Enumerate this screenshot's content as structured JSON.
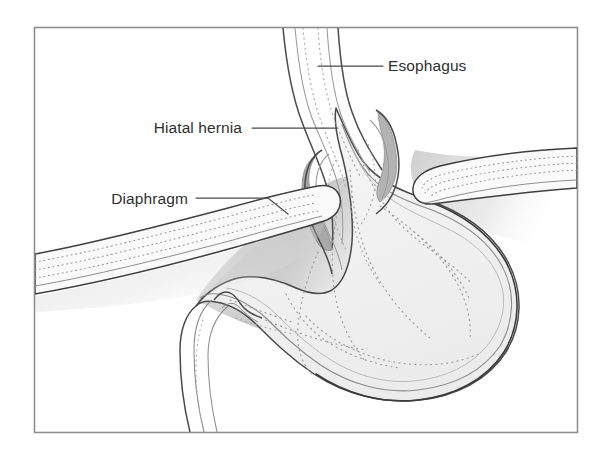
{
  "figure": {
    "kind": "medical-illustration",
    "frame": {
      "border_color": "#8f8f92",
      "background_color": "#ffffff",
      "x": 34,
      "y": 27,
      "width": 544,
      "height": 406
    },
    "palette": {
      "outline_dark": "#3b3b3b",
      "outline_mid": "#6e6e6e",
      "outline_light": "#a9a9a9",
      "wall_fill": "#f4f4f4",
      "lumen_fill": "#ffffff",
      "hernia_band": "#a8a8a8",
      "hernia_band_light": "#c4c4c4",
      "shadow_dark": "#c4c4c4",
      "shadow_light": "#ededed",
      "dotted_rugae": "#9a9a9a",
      "text_color": "#2f2f2f",
      "leader_line_color": "#4a4a4a"
    }
  },
  "labels": [
    {
      "id": "esophagus",
      "text": "Esophagus",
      "text_x": 388,
      "text_y": 71,
      "anchor": "start",
      "leader": "M 318 66 L 383 66"
    },
    {
      "id": "hiatal-hernia",
      "text": "Hiatal hernia",
      "text_x": 242,
      "text_y": 133,
      "anchor": "end",
      "leader": "M 252 128 L 337 128"
    },
    {
      "id": "diaphragm",
      "text": "Diaphragm",
      "text_x": 188,
      "text_y": 204,
      "anchor": "end",
      "leader": "M 196 198 L 268 198 L 288 214"
    }
  ],
  "structures": [
    {
      "id": "esophagus-tube",
      "name": "Esophagus",
      "description": "Double-walled muscular tube descending from upper frame edge"
    },
    {
      "id": "hiatal-hernia-sac",
      "name": "Hiatal hernia",
      "description": "Portion of stomach herniating upward through the diaphragmatic hiatus, drawn with a darker grey wall band"
    },
    {
      "id": "diaphragm-left-leaf",
      "name": "Diaphragm (left crus)",
      "description": "Rounded dotted band entering from the left frame edge and terminating in a rounded tip at the hiatus"
    },
    {
      "id": "diaphragm-right-leaf",
      "name": "Diaphragm (right crus)",
      "description": "Rounded dotted band entering from the right frame edge and terminating in a rounded tip at the hiatus"
    },
    {
      "id": "stomach-body",
      "name": "Stomach",
      "description": "Large gastric body and fundus with scalloped outer wall and dotted internal rugae"
    },
    {
      "id": "duodenum",
      "name": "Duodenum",
      "description": "Tube leaving the pylorus, curving down and out of the lower frame edge"
    },
    {
      "id": "posterior-shadow",
      "name": "Posterior shadow",
      "description": "Soft grey gradient behind the stomach suggesting depth"
    }
  ]
}
